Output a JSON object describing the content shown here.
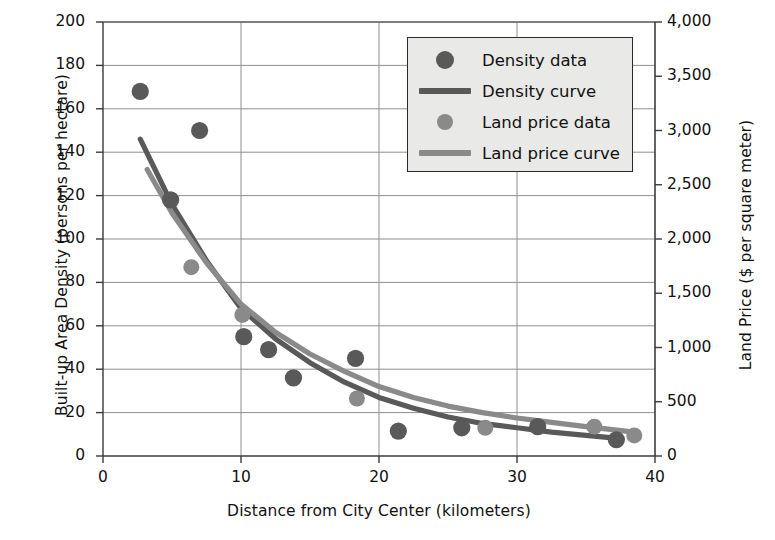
{
  "chart_data": {
    "type": "scatter",
    "title": "",
    "xlabel": "Distance from City Center (kilometers)",
    "ylabel": "Built-up Area Density (persons per hectare)",
    "y2label": "Land Price ($ per square meter)",
    "xlim": [
      0,
      40
    ],
    "ylim": [
      0,
      200
    ],
    "y2lim": [
      0,
      4000
    ],
    "xticks": [
      "0",
      "10",
      "20",
      "30",
      "40"
    ],
    "xtick_values": [
      0,
      10,
      20,
      30,
      40
    ],
    "yticks": [
      "0",
      "20",
      "40",
      "60",
      "80",
      "100",
      "120",
      "140",
      "160",
      "180",
      "200"
    ],
    "ytick_values": [
      0,
      20,
      40,
      60,
      80,
      100,
      120,
      140,
      160,
      180,
      200
    ],
    "y2ticks": [
      "0",
      "500",
      "1,000",
      "1,500",
      "2,000",
      "2,500",
      "3,000",
      "3,500",
      "4,000"
    ],
    "y2tick_values": [
      0,
      500,
      1000,
      1500,
      2000,
      2500,
      3000,
      3500,
      4000
    ],
    "grid": true,
    "legend_position": "top-right",
    "colors": {
      "density": "#595959",
      "land_price": "#8a8a8a",
      "grid": "#8f8f8f",
      "axis": "#3a3a3a",
      "legend_bg": "#e9e9e7"
    },
    "series": [
      {
        "name": "Density data",
        "type": "scatter",
        "axis": "left",
        "color": "#595959",
        "points": [
          {
            "x": 2.7,
            "y": 168
          },
          {
            "x": 4.9,
            "y": 118
          },
          {
            "x": 7.0,
            "y": 150
          },
          {
            "x": 10.2,
            "y": 55
          },
          {
            "x": 12.0,
            "y": 49
          },
          {
            "x": 13.8,
            "y": 36
          },
          {
            "x": 18.3,
            "y": 45
          },
          {
            "x": 21.4,
            "y": 11.5
          },
          {
            "x": 26.0,
            "y": 13
          },
          {
            "x": 31.5,
            "y": 13.5
          },
          {
            "x": 37.2,
            "y": 7.5
          }
        ]
      },
      {
        "name": "Land price data",
        "type": "scatter",
        "axis": "right",
        "color": "#8a8a8a",
        "points": [
          {
            "x": 6.4,
            "y": 87,
            "y2": 1740
          },
          {
            "x": 10.1,
            "y": 65,
            "y2": 1300
          },
          {
            "x": 18.4,
            "y": 26.5,
            "y2": 530
          },
          {
            "x": 27.7,
            "y": 13,
            "y2": 260
          },
          {
            "x": 35.6,
            "y": 13.5,
            "y2": 270
          },
          {
            "x": 38.5,
            "y": 9.5,
            "y2": 190
          }
        ]
      },
      {
        "name": "Density curve",
        "type": "line",
        "axis": "left",
        "color": "#595959",
        "points": [
          {
            "x": 2.7,
            "y": 146
          },
          {
            "x": 5.0,
            "y": 116
          },
          {
            "x": 7.5,
            "y": 90
          },
          {
            "x": 10.0,
            "y": 68
          },
          {
            "x": 12.5,
            "y": 54
          },
          {
            "x": 15.0,
            "y": 43
          },
          {
            "x": 17.5,
            "y": 34
          },
          {
            "x": 20.0,
            "y": 27
          },
          {
            "x": 22.5,
            "y": 22
          },
          {
            "x": 25.0,
            "y": 18
          },
          {
            "x": 27.5,
            "y": 15
          },
          {
            "x": 30.0,
            "y": 13
          },
          {
            "x": 32.5,
            "y": 11
          },
          {
            "x": 35.0,
            "y": 9.5
          },
          {
            "x": 37.5,
            "y": 8
          }
        ]
      },
      {
        "name": "Land price curve",
        "type": "line",
        "axis": "right",
        "color": "#8a8a8a",
        "points": [
          {
            "x": 3.2,
            "y": 132
          },
          {
            "x": 5.0,
            "y": 112
          },
          {
            "x": 7.5,
            "y": 89
          },
          {
            "x": 10.0,
            "y": 70
          },
          {
            "x": 12.5,
            "y": 57
          },
          {
            "x": 15.0,
            "y": 47
          },
          {
            "x": 17.5,
            "y": 39
          },
          {
            "x": 20.0,
            "y": 32
          },
          {
            "x": 22.5,
            "y": 27
          },
          {
            "x": 25.0,
            "y": 23
          },
          {
            "x": 27.5,
            "y": 20
          },
          {
            "x": 30.0,
            "y": 17.5
          },
          {
            "x": 32.5,
            "y": 15.5
          },
          {
            "x": 35.0,
            "y": 13.5
          },
          {
            "x": 38.5,
            "y": 11
          }
        ]
      }
    ],
    "legend": [
      {
        "label": "Density data",
        "marker": "dot",
        "color": "#595959",
        "size": 9
      },
      {
        "label": "Density curve",
        "marker": "line",
        "color": "#595959"
      },
      {
        "label": "Land price data",
        "marker": "dot",
        "color": "#8a8a8a",
        "size": 8
      },
      {
        "label": "Land price curve",
        "marker": "line",
        "color": "#8a8a8a"
      }
    ]
  }
}
